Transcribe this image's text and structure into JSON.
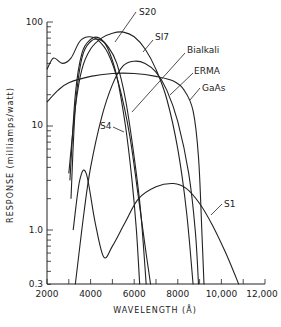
{
  "chart_data": {
    "type": "line",
    "title": "",
    "xlabel": "WAVELENGTH (Å)",
    "ylabel": "RESPONSE (milliamps/watt)",
    "xscale": "linear",
    "yscale": "log",
    "xlim": [
      2000,
      12000
    ],
    "ylim": [
      0.3,
      100
    ],
    "x_ticks": [
      2000,
      4000,
      6000,
      8000,
      10000,
      12000
    ],
    "x_tick_labels": [
      "2000",
      "4000",
      "6000",
      "8000",
      "10,000",
      "12,000"
    ],
    "y_ticks": [
      0.3,
      1.0,
      10,
      100
    ],
    "y_tick_labels": [
      "0.3",
      "1.0",
      "10",
      "100"
    ],
    "grid": false,
    "legend": "inline labels with leader arrows",
    "series": [
      {
        "name": "S20",
        "x": [
          3000,
          3300,
          3600,
          4000,
          4500,
          5000,
          5500,
          6000,
          6500,
          7000,
          7500,
          8000,
          8400,
          8700
        ],
        "y": [
          3.5,
          15,
          35,
          55,
          70,
          78,
          80,
          72,
          55,
          35,
          18,
          6,
          1.5,
          0.3
        ]
      },
      {
        "name": "S17",
        "x": [
          3050,
          3300,
          3600,
          4000,
          4400,
          4800,
          5200,
          5600,
          5900,
          6100,
          6250
        ],
        "y": [
          3.0,
          20,
          50,
          68,
          70,
          55,
          30,
          10,
          3,
          1.0,
          0.3
        ]
      },
      {
        "name": "Bialkali",
        "x": [
          3100,
          3300,
          3600,
          4000,
          4400,
          4800,
          5200,
          5600,
          6000,
          6300,
          6550
        ],
        "y": [
          2.0,
          15,
          45,
          65,
          68,
          58,
          40,
          18,
          5,
          1.5,
          0.3
        ]
      },
      {
        "name": "ERMA",
        "x": [
          3300,
          3700,
          4000,
          4500,
          5000,
          5500,
          6000,
          6500,
          7000,
          7500,
          8000,
          8500,
          8800,
          8950
        ],
        "y": [
          0.3,
          1.5,
          4,
          12,
          25,
          38,
          42,
          40,
          33,
          22,
          11,
          3.5,
          1.0,
          0.3
        ]
      },
      {
        "name": "GaAs",
        "x": [
          2000,
          2500,
          3000,
          4000,
          5000,
          6000,
          7000,
          7800,
          8300,
          8700,
          8950,
          9100,
          9200
        ],
        "y": [
          17,
          22,
          26,
          30,
          32,
          32,
          30,
          27,
          22,
          14,
          5,
          1.0,
          0.3
        ]
      },
      {
        "name": "S4",
        "x": [
          2000,
          2300,
          2700,
          3100,
          3500,
          3900,
          4300,
          4800,
          5300,
          5800,
          6200,
          6500,
          6750
        ],
        "y": [
          35,
          45,
          40,
          45,
          65,
          72,
          68,
          50,
          25,
          8,
          2.0,
          0.7,
          0.3
        ]
      },
      {
        "name": "S1",
        "x": [
          3200,
          3500,
          3800,
          4200,
          4600,
          5000,
          5600,
          6200,
          7000,
          7800,
          8400,
          9000,
          9600,
          10200,
          10800
        ],
        "y": [
          1.0,
          3.0,
          3.5,
          1.2,
          0.55,
          0.7,
          1.2,
          2.0,
          2.6,
          2.8,
          2.5,
          1.8,
          1.1,
          0.6,
          0.3
        ]
      }
    ],
    "annotations": [
      {
        "text": "S20",
        "label_pos": [
          245,
          125
        ]
      },
      {
        "text": "S17",
        "label_pos": [
          255,
          60
        ]
      },
      {
        "text": "Bialkali",
        "label_pos": [
          290,
          48
        ]
      },
      {
        "text": "ERMA",
        "label_pos": [
          298,
          70
        ]
      },
      {
        "text": "GaAs",
        "label_pos": [
          305,
          88
        ]
      },
      {
        "text": "S4",
        "label_pos": [
          93,
          135
        ]
      },
      {
        "text": "S1",
        "label_pos": [
          222,
          185
        ]
      }
    ]
  },
  "labels": {
    "S20": "S20",
    "S17": "SI7",
    "Bialkali": "Bialkali",
    "ERMA": "ERMA",
    "GaAs": "GaAs",
    "S4": "S4",
    "S1": "S1"
  },
  "axes": {
    "xlabel": "WAVELENGTH (Å)",
    "ylabel": "RESPONSE (milliamps/watt)",
    "x_tick_labels": [
      "2000",
      "4000",
      "6000",
      "8000",
      "10,000",
      "12,000"
    ],
    "y_tick_labels": {
      "t100": "100",
      "t10": "10",
      "t1": "1.0",
      "t03": "0.3"
    }
  }
}
